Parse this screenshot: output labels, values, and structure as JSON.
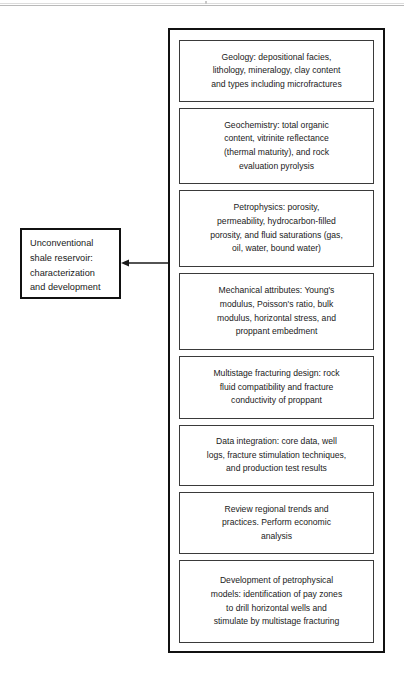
{
  "diagram": {
    "title_node": {
      "label": "Unconventional\nshale reservoir:\ncharacterization\nand development"
    },
    "connector": {
      "icon": "left-arrow-icon",
      "direction": "left"
    },
    "group_box": {
      "items": [
        {
          "id": "geology",
          "label": "Geology: depositional facies,\nlithology, mineralogy, clay content\nand types including microfractures"
        },
        {
          "id": "geochemistry",
          "label": "Geochemistry: total organic\ncontent, vitrinite reflectance\n(thermal maturity), and rock\nevaluation pyrolysis"
        },
        {
          "id": "petrophysics",
          "label": "Petrophysics: porosity,\npermeability, hydrocarbon-filled\nporosity, and fluid saturations (gas,\noil, water, bound water)"
        },
        {
          "id": "mechanical-attributes",
          "label": "Mechanical attributes: Young's\nmodulus, Poisson's ratio, bulk\nmodulus, horizontal stress, and\nproppant embedment"
        },
        {
          "id": "multistage-fracturing-design",
          "label": "Multistage fracturing design: rock\nfluid compatibility and fracture\nconductivity of proppant"
        },
        {
          "id": "data-integration",
          "label": "Data integration: core data, well\nlogs, fracture stimulation techniques,\nand production test results"
        },
        {
          "id": "review-regional-trends",
          "label": "Review regional trends and\npractices. Perform economic\nanalysis"
        },
        {
          "id": "development-petrophysical-models",
          "label": "Development of petrophysical\nmodels: identification of pay zones\nto drill horizontal wells and\nstimulate by multistage fracturing"
        }
      ]
    },
    "colors": {
      "stroke": "#111111",
      "item_stroke": "#3a3a3a",
      "text": "#1a1a1a",
      "background": "#ffffff"
    }
  }
}
